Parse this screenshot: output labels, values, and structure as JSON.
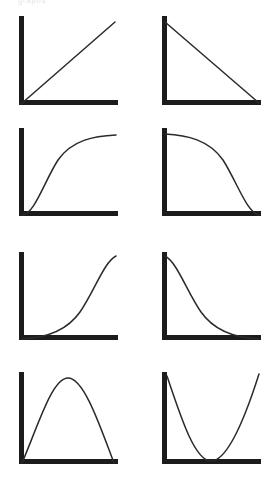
{
  "page": {
    "background_color": "#ffffff",
    "axis_color": "#1c1c1c",
    "curve_color": "#2a2a2a",
    "ghost_caption": "graphs"
  },
  "chart_data": [
    {
      "type": "line",
      "title": "Linear increasing",
      "panel": 1,
      "row": 1,
      "column": 1,
      "xlabel": "",
      "ylabel": "",
      "xlim": [
        0,
        1
      ],
      "ylim": [
        0,
        1
      ],
      "grid": false,
      "legend": "none",
      "relationship": "positive linear",
      "x": [
        0.0,
        0.25,
        0.5,
        0.75,
        1.0
      ],
      "y": [
        0.0,
        0.25,
        0.5,
        0.75,
        1.0
      ],
      "axes": {
        "x_start": 20,
        "x_end": 118,
        "y_top": 16,
        "y_bottom": 105
      },
      "path": "M 21 104 L 115 22"
    },
    {
      "type": "line",
      "title": "Linear decreasing",
      "panel": 2,
      "row": 1,
      "column": 2,
      "xlabel": "",
      "ylabel": "",
      "xlim": [
        0,
        1
      ],
      "ylim": [
        0,
        1
      ],
      "grid": false,
      "legend": "none",
      "relationship": "negative linear",
      "x": [
        0.0,
        0.25,
        0.5,
        0.75,
        1.0
      ],
      "y": [
        1.0,
        0.75,
        0.5,
        0.25,
        0.0
      ],
      "axes": {
        "x_start": 25,
        "x_end": 123,
        "y_top": 16,
        "y_bottom": 105
      },
      "path": "M 27 22 L 121 103"
    },
    {
      "type": "line",
      "title": "Concave increasing (saturating)",
      "panel": 3,
      "row": 2,
      "column": 1,
      "xlabel": "",
      "ylabel": "",
      "xlim": [
        0,
        1
      ],
      "ylim": [
        0,
        1
      ],
      "grid": false,
      "legend": "none",
      "relationship": "positive, decreasing slope",
      "x": [
        0.0,
        0.25,
        0.5,
        0.75,
        1.0
      ],
      "y": [
        0.0,
        0.62,
        0.85,
        0.96,
        1.0
      ],
      "axes": {
        "x_start": 20,
        "x_end": 118,
        "y_top": 8,
        "y_bottom": 96
      },
      "path": "M 22 95 C 34 95 44 62 58 40 C 72 20 94 16 116 15"
    },
    {
      "type": "line",
      "title": "Concave decreasing",
      "panel": 4,
      "row": 2,
      "column": 2,
      "xlabel": "",
      "ylabel": "",
      "xlim": [
        0,
        1
      ],
      "ylim": [
        0,
        1
      ],
      "grid": false,
      "legend": "none",
      "relationship": "negative, steepening slope",
      "x": [
        0.0,
        0.25,
        0.5,
        0.75,
        1.0
      ],
      "y": [
        1.0,
        0.96,
        0.85,
        0.62,
        0.0
      ],
      "axes": {
        "x_start": 25,
        "x_end": 123,
        "y_top": 8,
        "y_bottom": 96
      },
      "path": "M 27 14 C 49 15 71 20 85 40 C 99 62 109 93 121 95"
    },
    {
      "type": "line",
      "title": "Convex increasing (exponential growth)",
      "panel": 5,
      "row": 3,
      "column": 1,
      "xlabel": "",
      "ylabel": "",
      "xlim": [
        0,
        1
      ],
      "ylim": [
        0,
        1
      ],
      "grid": false,
      "legend": "none",
      "relationship": "positive, increasing slope",
      "x": [
        0.0,
        0.25,
        0.5,
        0.75,
        1.0
      ],
      "y": [
        0.0,
        0.04,
        0.15,
        0.38,
        1.0
      ],
      "axes": {
        "x_start": 20,
        "x_end": 118,
        "y_top": 12,
        "y_bottom": 100
      },
      "path": "M 22 99 C 44 98 66 92 80 72 C 94 52 104 22 116 16"
    },
    {
      "type": "line",
      "title": "Convex decreasing (exponential decay)",
      "panel": 6,
      "row": 3,
      "column": 2,
      "xlabel": "",
      "ylabel": "",
      "xlim": [
        0,
        1
      ],
      "ylim": [
        0,
        1
      ],
      "grid": false,
      "legend": "none",
      "relationship": "negative, flattening slope",
      "x": [
        0.0,
        0.25,
        0.5,
        0.75,
        1.0
      ],
      "y": [
        1.0,
        0.38,
        0.15,
        0.04,
        0.0
      ],
      "axes": {
        "x_start": 25,
        "x_end": 123,
        "y_top": 12,
        "y_bottom": 100
      },
      "path": "M 27 16 C 39 22 49 52 63 72 C 77 92 99 98 121 99"
    },
    {
      "type": "line",
      "title": "Inverted U (concave, interior maximum)",
      "panel": 7,
      "row": 4,
      "column": 1,
      "xlabel": "",
      "ylabel": "",
      "xlim": [
        0,
        1
      ],
      "ylim": [
        0,
        1
      ],
      "grid": false,
      "legend": "none",
      "relationship": "rises to a peak then falls",
      "x": [
        0.0,
        0.25,
        0.5,
        0.75,
        1.0
      ],
      "y": [
        0.0,
        0.75,
        1.0,
        0.75,
        0.0
      ],
      "peak_x": 0.5,
      "axes": {
        "x_start": 20,
        "x_end": 118,
        "y_top": 12,
        "y_bottom": 104
      },
      "path": "M 22 103 C 38 66 52 18 68 18 C 84 18 100 66 114 103"
    },
    {
      "type": "line",
      "title": "U shape (convex, interior minimum)",
      "panel": 8,
      "row": 4,
      "column": 2,
      "xlabel": "",
      "ylabel": "",
      "xlim": [
        0,
        1
      ],
      "ylim": [
        0,
        1
      ],
      "grid": false,
      "legend": "none",
      "relationship": "falls to a trough then rises",
      "x": [
        0.0,
        0.25,
        0.5,
        0.75,
        1.0
      ],
      "y": [
        1.0,
        0.25,
        0.0,
        0.25,
        1.0
      ],
      "trough_x": 0.5,
      "axes": {
        "x_start": 25,
        "x_end": 123,
        "y_top": 12,
        "y_bottom": 104
      },
      "path": "M 29 16 C 43 58 57 101 73 101 C 89 101 107 58 121 14"
    }
  ]
}
